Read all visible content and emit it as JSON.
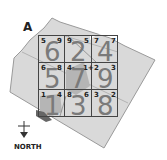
{
  "diagram": {
    "label": "A",
    "north_label": "NORTH",
    "colors": {
      "parcel_fill": "#d9d9d9",
      "parcel_stroke": "#9a9a9a",
      "grid_stroke": "#444444",
      "highlight_fill": "#b5b5b5",
      "big_digit": "#7a7a7a"
    },
    "grid": {
      "rows": [
        [
          {
            "big": "6",
            "tl": "5",
            "tr": "9"
          },
          {
            "big": "2",
            "tl": "9",
            "tr": "5"
          },
          {
            "big": "4",
            "tl": "7",
            "tr": "7"
          }
        ],
        [
          {
            "big": "5",
            "tl": "6",
            "tr": "8"
          },
          {
            "big": "7",
            "tl": "4-",
            "tr": "1+"
          },
          {
            "big": "9",
            "tl": "2",
            "tr": "3"
          }
        ],
        [
          {
            "big": "1",
            "tl": "1",
            "tr": "4"
          },
          {
            "big": "3",
            "tl": "8",
            "tr": "6"
          },
          {
            "big": "8",
            "tl": "3",
            "tr": "2"
          }
        ]
      ]
    }
  }
}
